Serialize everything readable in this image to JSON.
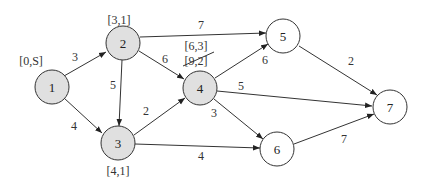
{
  "diagram": {
    "type": "weighted-directed-graph",
    "nodes": [
      {
        "id": "1",
        "label": "1",
        "annotation": "[0,S]",
        "shaded": true
      },
      {
        "id": "2",
        "label": "2",
        "annotation": "[3,1]",
        "shaded": true
      },
      {
        "id": "3",
        "label": "3",
        "annotation": "[4,1]",
        "shaded": true
      },
      {
        "id": "4",
        "label": "4",
        "annotation": "[6,3]",
        "annotation_struck": "[9,2]",
        "shaded": true
      },
      {
        "id": "5",
        "label": "5",
        "shaded": false
      },
      {
        "id": "6",
        "label": "6",
        "shaded": false
      },
      {
        "id": "7",
        "label": "7",
        "shaded": false
      }
    ],
    "edges": [
      {
        "from": "1",
        "to": "2",
        "weight": "3"
      },
      {
        "from": "1",
        "to": "3",
        "weight": "4"
      },
      {
        "from": "2",
        "to": "3",
        "weight": "5"
      },
      {
        "from": "2",
        "to": "4",
        "weight": "6"
      },
      {
        "from": "2",
        "to": "5",
        "weight": "7"
      },
      {
        "from": "3",
        "to": "4",
        "weight": "2"
      },
      {
        "from": "3",
        "to": "6",
        "weight": "4"
      },
      {
        "from": "4",
        "to": "5",
        "weight": "6"
      },
      {
        "from": "4",
        "to": "6",
        "weight": "3"
      },
      {
        "from": "4",
        "to": "7",
        "weight": "5"
      },
      {
        "from": "5",
        "to": "7",
        "weight": "2"
      },
      {
        "from": "6",
        "to": "7",
        "weight": "7"
      }
    ]
  }
}
